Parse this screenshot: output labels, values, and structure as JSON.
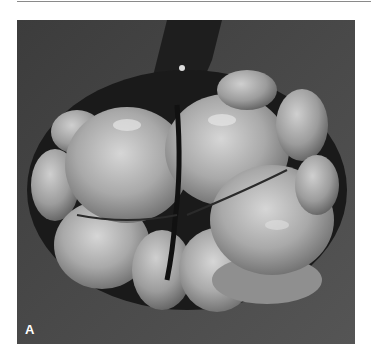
{
  "figure": {
    "panel_label": "A",
    "colors": {
      "background": "#ffffff",
      "photo_background": "#4a4a4a",
      "lobule_light": "#bdbdbd",
      "lobule_dark": "#6f6f6f",
      "cleft": "#161616",
      "label": "#ffffff"
    }
  }
}
